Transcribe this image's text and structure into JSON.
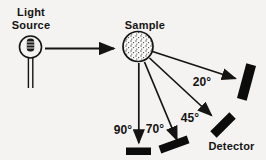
{
  "diagram": {
    "source_label": [
      "Light",
      "Source"
    ],
    "sample_label": "Sample",
    "detector_label": "Detector",
    "angle_labels": {
      "a20": "20°",
      "a45": "45°",
      "a70": "70°",
      "a90": "90°"
    },
    "angle_values_degrees": [
      20,
      45,
      70,
      90
    ]
  },
  "colors": {
    "background": "#f4f3f1",
    "ink": "#141414",
    "detector_fill": "#0c0c0c",
    "stipple_dot": "#3a3a3a",
    "sample_fill": "#fafaf8"
  }
}
